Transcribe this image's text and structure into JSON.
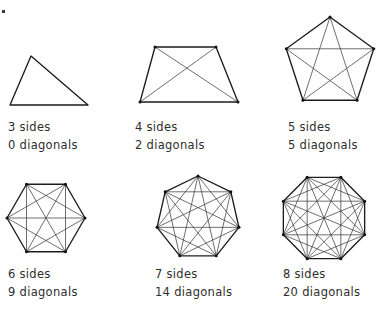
{
  "figure": {
    "background_color": "#ffffff",
    "side_color": "#1c1c1c",
    "diagonal_color": "#3d3d3d",
    "text_color": "#2e2e2e",
    "corner_mark": "speck"
  },
  "panels": [
    {
      "id": "triangle",
      "sides": 3,
      "diagonals": 0,
      "sides_label": "3 sides",
      "diagonals_label": "0 diagonals",
      "label_x": 8,
      "label_y": 118,
      "shape": {
        "type": "explicit",
        "points": [
          [
            31,
            56
          ],
          [
            88,
            105
          ],
          [
            10,
            105
          ]
        ],
        "show_vertex_dots": false
      }
    },
    {
      "id": "quadrilateral",
      "sides": 4,
      "diagonals": 2,
      "sides_label": "4 sides",
      "diagonals_label": "2 diagonals",
      "label_x": 135,
      "label_y": 118,
      "shape": {
        "type": "explicit",
        "points": [
          [
            155,
            47
          ],
          [
            216,
            47
          ],
          [
            238,
            102
          ],
          [
            140,
            102
          ]
        ],
        "show_vertex_dots": true
      }
    },
    {
      "id": "pentagon",
      "sides": 5,
      "diagonals": 5,
      "sides_label": "5 sides",
      "diagonals_label": "5 diagonals",
      "label_x": 288,
      "label_y": 118,
      "shape": {
        "type": "regular",
        "cx": 330,
        "cy": 63,
        "r": 46,
        "rotation": -90,
        "show_vertex_dots": true
      }
    },
    {
      "id": "hexagon",
      "sides": 6,
      "diagonals": 9,
      "sides_label": "6 sides",
      "diagonals_label": "9 diagonals",
      "label_x": 8,
      "label_y": 265,
      "shape": {
        "type": "regular",
        "cx": 46,
        "cy": 218,
        "r": 39,
        "rotation": 0,
        "show_vertex_dots": true
      }
    },
    {
      "id": "heptagon",
      "sides": 7,
      "diagonals": 14,
      "sides_label": "7 sides",
      "diagonals_label": "14 diagonals",
      "label_x": 155,
      "label_y": 265,
      "shape": {
        "type": "regular",
        "cx": 198,
        "cy": 218,
        "r": 42,
        "rotation": -90,
        "show_vertex_dots": true
      }
    },
    {
      "id": "octagon",
      "sides": 8,
      "diagonals": 20,
      "sides_label": "8 sides",
      "diagonals_label": "20 diagonals",
      "label_x": 283,
      "label_y": 265,
      "shape": {
        "type": "regular",
        "cx": 324,
        "cy": 218,
        "r": 44,
        "rotation": -67.5,
        "show_vertex_dots": true
      }
    }
  ]
}
